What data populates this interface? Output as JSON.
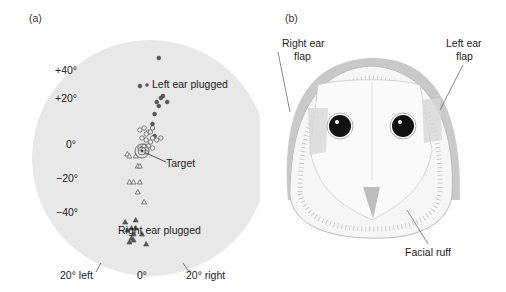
{
  "panel_a": {
    "label": "(a)",
    "y_ticks": [
      "+40°",
      "+20°",
      "0°",
      "−20°",
      "−40°"
    ],
    "x_ticks": [
      "20° left",
      "0°",
      "20° right"
    ],
    "annotations": {
      "left_ear": "Left ear plugged",
      "target": "Target",
      "right_ear": "Right ear plugged"
    }
  },
  "panel_b": {
    "label": "(b)",
    "annotations": {
      "right_flap_1": "Right ear",
      "right_flap_2": "flap",
      "left_flap_1": "Left ear",
      "left_flap_2": "flap",
      "ruff": "Facial ruff"
    }
  },
  "chart_data": {
    "type": "scatter",
    "title": "",
    "xlabel": "Azimuth",
    "ylabel": "Elevation",
    "series": [
      {
        "name": "Left ear plugged",
        "marker": "filled-circle",
        "points": [
          [
            8,
            44
          ],
          [
            -1,
            30
          ],
          [
            9,
            24
          ],
          [
            10,
            25
          ],
          [
            7,
            22
          ],
          [
            12,
            22
          ],
          [
            8,
            20
          ],
          [
            6,
            16
          ],
          [
            5,
            11
          ],
          [
            6,
            5
          ]
        ]
      },
      {
        "name": "Normal",
        "marker": "open-circle",
        "points": [
          [
            -1,
            8
          ],
          [
            1,
            9
          ],
          [
            3,
            7
          ],
          [
            5,
            9
          ],
          [
            2,
            6
          ],
          [
            4,
            7
          ],
          [
            0,
            4
          ],
          [
            2,
            3
          ],
          [
            4,
            2
          ],
          [
            5,
            4
          ],
          [
            7,
            3
          ],
          [
            1,
            0
          ],
          [
            3,
            0
          ],
          [
            5,
            -1
          ],
          [
            -1,
            -1
          ],
          [
            2,
            -3
          ],
          [
            9,
            4
          ]
        ]
      },
      {
        "name": "Right ear plugged (partial)",
        "marker": "open-triangle",
        "points": [
          [
            -7,
            -4
          ],
          [
            -6,
            -5
          ],
          [
            -3,
            -5
          ],
          [
            -2,
            -10
          ],
          [
            -1,
            -10
          ],
          [
            -6,
            -18
          ],
          [
            -4,
            -18
          ],
          [
            -1,
            -18
          ],
          [
            -2,
            -23
          ],
          [
            1,
            -28
          ]
        ]
      },
      {
        "name": "Right ear plugged",
        "marker": "filled-triangle",
        "points": [
          [
            -8,
            -38
          ],
          [
            -7,
            -42
          ],
          [
            -5,
            -41
          ],
          [
            -4,
            -44
          ],
          [
            -3,
            -41
          ],
          [
            -4,
            -47
          ],
          [
            -6,
            -48
          ],
          [
            -5,
            -46
          ],
          [
            0,
            -44
          ],
          [
            2,
            -49
          ],
          [
            -3,
            -37
          ]
        ]
      }
    ],
    "target": [
      0,
      -5
    ],
    "xlim": [
      -35,
      35
    ],
    "ylim": [
      -60,
      55
    ]
  }
}
